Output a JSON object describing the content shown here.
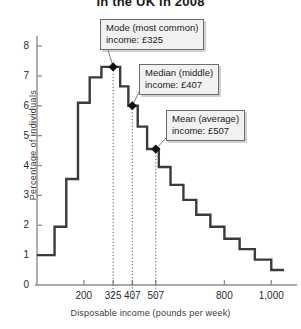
{
  "chart_data": {
    "type": "line",
    "title": "in the UK in 2008",
    "xlabel": "Disposable income (pounds per week)",
    "ylabel": "Percentage of individuals",
    "xlim": [
      0,
      1080
    ],
    "ylim": [
      0,
      8.6
    ],
    "grid": false,
    "legend": "none",
    "x_ticks": [
      200,
      325,
      407,
      507,
      800,
      1000
    ],
    "x_tick_labels": [
      "200",
      "325",
      "407",
      "507",
      "800",
      "1,000"
    ],
    "y_ticks": [
      0,
      1,
      2,
      3,
      4,
      5,
      6,
      7,
      8
    ],
    "y_tick_labels": [
      "0",
      "1",
      "2",
      "3",
      "4",
      "5",
      "6",
      "7",
      "8"
    ],
    "series_name": "Percentage of individuals",
    "step_bins": [
      {
        "x0": 0,
        "x1": 75,
        "y": 1.0
      },
      {
        "x0": 75,
        "x1": 125,
        "y": 1.95
      },
      {
        "x0": 125,
        "x1": 175,
        "y": 3.55
      },
      {
        "x0": 175,
        "x1": 225,
        "y": 6.1
      },
      {
        "x0": 225,
        "x1": 275,
        "y": 6.95
      },
      {
        "x0": 275,
        "x1": 355,
        "y": 7.3
      },
      {
        "x0": 355,
        "x1": 390,
        "y": 6.65
      },
      {
        "x0": 390,
        "x1": 430,
        "y": 6.0
      },
      {
        "x0": 430,
        "x1": 470,
        "y": 5.3
      },
      {
        "x0": 470,
        "x1": 520,
        "y": 4.55
      },
      {
        "x0": 520,
        "x1": 570,
        "y": 3.95
      },
      {
        "x0": 570,
        "x1": 625,
        "y": 3.35
      },
      {
        "x0": 625,
        "x1": 680,
        "y": 2.85
      },
      {
        "x0": 680,
        "x1": 740,
        "y": 2.35
      },
      {
        "x0": 740,
        "x1": 800,
        "y": 1.95
      },
      {
        "x0": 800,
        "x1": 865,
        "y": 1.55
      },
      {
        "x0": 865,
        "x1": 930,
        "y": 1.2
      },
      {
        "x0": 930,
        "x1": 1000,
        "y": 0.85
      },
      {
        "x0": 1000,
        "x1": 1055,
        "y": 0.5
      }
    ],
    "markers": [
      {
        "name": "mode",
        "x": 325,
        "y": 7.3
      },
      {
        "name": "median",
        "x": 407,
        "y": 6.0
      },
      {
        "name": "mean",
        "x": 507,
        "y": 4.55
      }
    ],
    "annotations": [
      {
        "id": "mode",
        "line1": "Mode (most common)",
        "line2": "income: £325",
        "value": 325,
        "box": {
          "left": 100,
          "top": 19
        }
      },
      {
        "id": "median",
        "line1": "Median (middle)",
        "line2": "income: £407",
        "value": 407,
        "box": {
          "left": 139,
          "top": 64
        }
      },
      {
        "id": "mean",
        "line1": "Mean (average)",
        "line2": "income: £507",
        "value": 507,
        "box": {
          "left": 166,
          "top": 110
        }
      }
    ],
    "colors": {
      "curve": "#3b3b3b",
      "axis": "#8c8c8c",
      "marker": "#111111",
      "callout_bg": "#f1f1f1",
      "callout_border": "#6e6e6e",
      "dotted_guide": "#4a4a4a"
    }
  }
}
